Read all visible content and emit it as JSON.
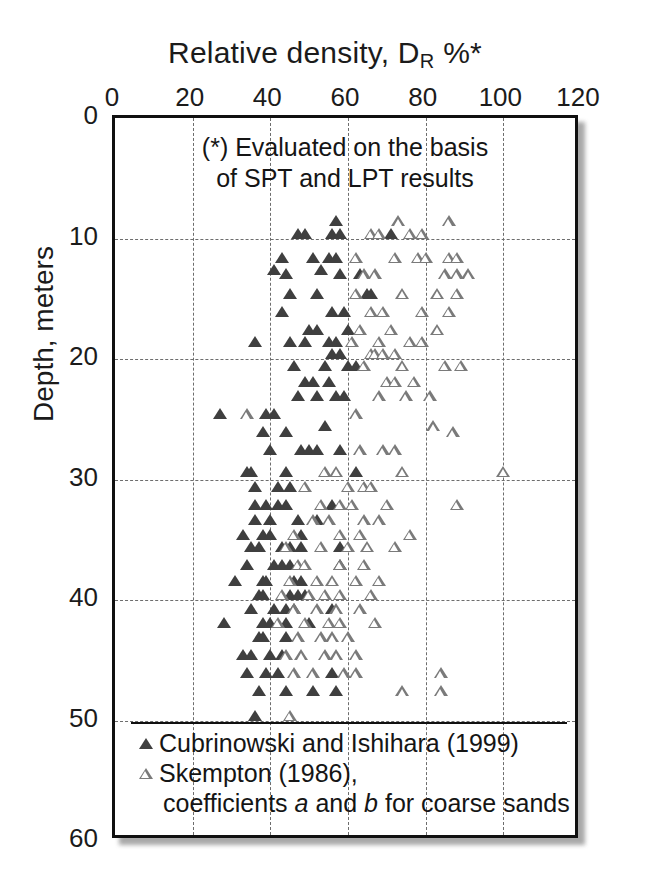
{
  "chart_data": {
    "type": "scatter",
    "title_parts": {
      "main": "Relative density, D",
      "subscript": "R",
      "suffix": "%*"
    },
    "xlabel": "Relative density, D_R %*",
    "ylabel": "Depth, meters",
    "xlim": [
      0,
      120
    ],
    "ylim": [
      0,
      60
    ],
    "y_inverted": true,
    "grid": true,
    "x_ticks": [
      0,
      20,
      40,
      60,
      80,
      100,
      120
    ],
    "y_ticks": [
      0,
      10,
      20,
      30,
      40,
      50,
      60
    ],
    "annotation": [
      "(*) Evaluated on the basis",
      "of SPT and LPT results"
    ],
    "legend_position": "inside-bottom-left",
    "series": [
      {
        "name": "Cubrinowski and Ishihara (1999)",
        "marker": "filled-triangle",
        "color": "#3f3f3f",
        "points": [
          [
            57,
            9
          ],
          [
            47,
            10
          ],
          [
            49,
            10
          ],
          [
            56,
            10
          ],
          [
            58,
            10
          ],
          [
            71,
            10
          ],
          [
            43,
            12
          ],
          [
            51,
            12
          ],
          [
            55,
            12
          ],
          [
            57,
            12
          ],
          [
            41,
            13
          ],
          [
            53,
            13
          ],
          [
            44,
            13.4
          ],
          [
            58,
            13.4
          ],
          [
            63,
            13.4
          ],
          [
            45,
            15
          ],
          [
            52,
            15
          ],
          [
            65,
            15
          ],
          [
            66,
            15
          ],
          [
            43,
            16.5
          ],
          [
            56,
            16.5
          ],
          [
            59,
            16.5
          ],
          [
            50,
            18
          ],
          [
            52,
            18
          ],
          [
            60,
            18
          ],
          [
            36,
            19
          ],
          [
            45,
            19
          ],
          [
            49,
            19
          ],
          [
            55,
            19
          ],
          [
            57,
            19
          ],
          [
            56,
            20
          ],
          [
            58,
            20
          ],
          [
            46,
            21
          ],
          [
            54,
            21
          ],
          [
            60,
            21
          ],
          [
            62,
            21
          ],
          [
            49,
            22.3
          ],
          [
            51,
            22.3
          ],
          [
            55,
            22.3
          ],
          [
            47,
            23.5
          ],
          [
            52,
            23.5
          ],
          [
            57,
            23.5
          ],
          [
            59,
            23.5
          ],
          [
            27,
            25
          ],
          [
            39,
            25
          ],
          [
            41,
            25
          ],
          [
            54,
            26
          ],
          [
            38,
            26.5
          ],
          [
            44,
            26.5
          ],
          [
            40,
            28
          ],
          [
            48,
            28
          ],
          [
            50,
            28
          ],
          [
            52,
            28
          ],
          [
            58,
            28
          ],
          [
            34,
            29.8
          ],
          [
            35,
            29.8
          ],
          [
            44,
            29.8
          ],
          [
            62,
            29.8
          ],
          [
            36,
            31
          ],
          [
            42,
            31
          ],
          [
            45,
            31
          ],
          [
            36,
            32.5
          ],
          [
            39,
            32.5
          ],
          [
            42,
            32.5
          ],
          [
            44,
            32.5
          ],
          [
            56,
            32.5
          ],
          [
            36,
            33.8
          ],
          [
            40,
            33.8
          ],
          [
            47,
            33.8
          ],
          [
            52,
            33.8
          ],
          [
            33,
            35
          ],
          [
            38,
            35
          ],
          [
            40,
            35
          ],
          [
            48,
            35
          ],
          [
            35,
            36
          ],
          [
            37,
            36
          ],
          [
            43,
            36
          ],
          [
            45,
            36
          ],
          [
            48,
            36
          ],
          [
            58,
            36
          ],
          [
            34,
            37.5
          ],
          [
            41,
            37.5
          ],
          [
            43,
            37.5
          ],
          [
            45,
            37.5
          ],
          [
            58,
            37.5
          ],
          [
            31,
            38.8
          ],
          [
            38,
            38.8
          ],
          [
            39,
            38.8
          ],
          [
            46,
            38.8
          ],
          [
            48,
            38.8
          ],
          [
            37,
            40
          ],
          [
            38,
            40
          ],
          [
            45,
            40
          ],
          [
            47,
            40
          ],
          [
            49,
            40
          ],
          [
            35,
            41.2
          ],
          [
            41,
            41.2
          ],
          [
            44,
            41.2
          ],
          [
            46,
            41.2
          ],
          [
            56,
            41.2
          ],
          [
            28,
            42.3
          ],
          [
            38,
            42.3
          ],
          [
            40,
            42.3
          ],
          [
            44,
            42.3
          ],
          [
            50,
            42.3
          ],
          [
            37,
            43.5
          ],
          [
            38,
            43.5
          ],
          [
            44,
            43.5
          ],
          [
            33,
            45
          ],
          [
            35,
            45
          ],
          [
            40,
            45
          ],
          [
            43,
            45
          ],
          [
            34,
            46.5
          ],
          [
            39,
            46.5
          ],
          [
            42,
            46.5
          ],
          [
            56,
            46.5
          ],
          [
            37,
            48
          ],
          [
            44,
            48
          ],
          [
            51,
            48
          ],
          [
            57,
            48
          ],
          [
            36,
            50
          ]
        ]
      },
      {
        "name": "Skempton (1986), coefficients a and b for coarse sands",
        "marker": "open-triangle",
        "color": "#7a7a7a",
        "points": [
          [
            73,
            9
          ],
          [
            86,
            9
          ],
          [
            66,
            10
          ],
          [
            68,
            10
          ],
          [
            76,
            10
          ],
          [
            79,
            10
          ],
          [
            62,
            12
          ],
          [
            72,
            12
          ],
          [
            78,
            12
          ],
          [
            80,
            12
          ],
          [
            86,
            12
          ],
          [
            88,
            12
          ],
          [
            64,
            13.4
          ],
          [
            67,
            13.4
          ],
          [
            85,
            13.4
          ],
          [
            88,
            13.4
          ],
          [
            91,
            13.4
          ],
          [
            62,
            15
          ],
          [
            74,
            15
          ],
          [
            83,
            15
          ],
          [
            88,
            15
          ],
          [
            66,
            16.5
          ],
          [
            69,
            16.5
          ],
          [
            79,
            16.5
          ],
          [
            86,
            16.5
          ],
          [
            63,
            18
          ],
          [
            71,
            18
          ],
          [
            83,
            18
          ],
          [
            61,
            19
          ],
          [
            68,
            19
          ],
          [
            76,
            19
          ],
          [
            79,
            19
          ],
          [
            66,
            20
          ],
          [
            67,
            20
          ],
          [
            69,
            20
          ],
          [
            72,
            20
          ],
          [
            64,
            21
          ],
          [
            74,
            21
          ],
          [
            85,
            21
          ],
          [
            89,
            21
          ],
          [
            70,
            22.3
          ],
          [
            72,
            22.3
          ],
          [
            77,
            22.3
          ],
          [
            68,
            23.5
          ],
          [
            75,
            23.5
          ],
          [
            81,
            23.5
          ],
          [
            34,
            25
          ],
          [
            62,
            25
          ],
          [
            82,
            26
          ],
          [
            87,
            26.5
          ],
          [
            63,
            28
          ],
          [
            69,
            28
          ],
          [
            72,
            28
          ],
          [
            54,
            29.8
          ],
          [
            57,
            29.8
          ],
          [
            74,
            29.8
          ],
          [
            100,
            29.8
          ],
          [
            49,
            31
          ],
          [
            60,
            31
          ],
          [
            64,
            31
          ],
          [
            66,
            31
          ],
          [
            53,
            32.5
          ],
          [
            58,
            32.5
          ],
          [
            61,
            32.5
          ],
          [
            70,
            32.5
          ],
          [
            88,
            32.5
          ],
          [
            51,
            33.8
          ],
          [
            55,
            33.8
          ],
          [
            64,
            33.8
          ],
          [
            68,
            33.8
          ],
          [
            46,
            35
          ],
          [
            58,
            35
          ],
          [
            63,
            35
          ],
          [
            76,
            35
          ],
          [
            44,
            36
          ],
          [
            53,
            36
          ],
          [
            60,
            36
          ],
          [
            65,
            36
          ],
          [
            72,
            36
          ],
          [
            47,
            37.5
          ],
          [
            49,
            37.5
          ],
          [
            58,
            37.5
          ],
          [
            64,
            37.5
          ],
          [
            45,
            38.8
          ],
          [
            52,
            38.8
          ],
          [
            56,
            38.8
          ],
          [
            62,
            38.8
          ],
          [
            68,
            38.8
          ],
          [
            43,
            40
          ],
          [
            50,
            40
          ],
          [
            54,
            40
          ],
          [
            58,
            40
          ],
          [
            66,
            40
          ],
          [
            46,
            41.2
          ],
          [
            52,
            41.2
          ],
          [
            57,
            41.2
          ],
          [
            63,
            41.2
          ],
          [
            42,
            42.3
          ],
          [
            49,
            42.3
          ],
          [
            55,
            42.3
          ],
          [
            58,
            42.3
          ],
          [
            67,
            42.3
          ],
          [
            47,
            43.5
          ],
          [
            53,
            43.5
          ],
          [
            56,
            43.5
          ],
          [
            60,
            43.5
          ],
          [
            44,
            45
          ],
          [
            48,
            45
          ],
          [
            54,
            45
          ],
          [
            57,
            45
          ],
          [
            62,
            45
          ],
          [
            46,
            46.5
          ],
          [
            51,
            46.5
          ],
          [
            59,
            46.5
          ],
          [
            62,
            46.5
          ],
          [
            84,
            46.5
          ],
          [
            74,
            48
          ],
          [
            84,
            48
          ],
          [
            45,
            50
          ]
        ]
      }
    ]
  },
  "axes": {
    "x_tick_labels": [
      "0",
      "20",
      "40",
      "60",
      "80",
      "100",
      "120"
    ],
    "y_tick_labels": [
      "0",
      "10",
      "20",
      "30",
      "40",
      "50",
      "60"
    ],
    "y_axis_title": "Depth, meters"
  },
  "annotation": {
    "line1": "(*) Evaluated on the basis",
    "line2": "of SPT and LPT results"
  },
  "legend": {
    "entry1": "Cubrinowski and Ishihara (1999)",
    "entry2": "Skempton (1986),",
    "entry2_cont_pre": "coefficients ",
    "entry2_cont_a": "a",
    "entry2_cont_mid": " and ",
    "entry2_cont_b": "b",
    "entry2_cont_post": " for coarse sands"
  },
  "colors": {
    "filled_marker": "#3f3f3f",
    "open_marker": "#7a7a7a",
    "frame": "#101010",
    "grid": "#6d6d6d",
    "text": "#151515",
    "background": "#ffffff"
  }
}
